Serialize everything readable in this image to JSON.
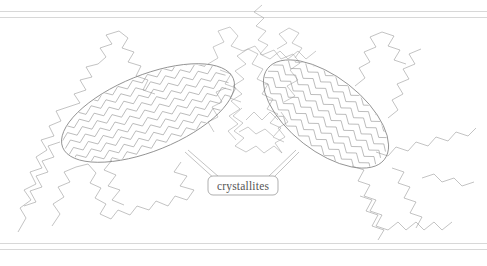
{
  "figure": {
    "name": "semicrystalline-polymer-morphology",
    "background_color": "#ffffff",
    "width": 487,
    "height": 266,
    "annotations": [
      {
        "id": "crystallites",
        "label": "crystallites",
        "box_x": 243,
        "box_y": 186
      }
    ],
    "colors": {
      "chain_stroke": "#9a9a9a",
      "lamella_stroke": "#7d7d7d",
      "rule_stroke": "#d8d8d8",
      "label_text": "#555555",
      "label_border": "#8d8d8d"
    },
    "rules": {
      "top": [
        11,
        17
      ],
      "bottom": [
        243,
        249
      ]
    },
    "crystallites": [
      {
        "id": "left-lamella",
        "cx": 148,
        "cy": 113,
        "rx": 92,
        "ry": 38,
        "rotation": -22,
        "chain_rows": 9,
        "description": "elongated oval containing parallel chain-folded zigzag segments"
      },
      {
        "id": "right-lamella",
        "cx": 326,
        "cy": 114,
        "rx": 74,
        "ry": 37,
        "rotation": 38,
        "chain_rows": 9,
        "description": "elongated oval containing parallel chain-folded zigzag segments"
      }
    ],
    "amorphous_region": {
      "id": "amorphous-tangle",
      "center_x": 252,
      "center_y": 92,
      "description": "dense randomly coiled polymer chains between and around the crystallites"
    }
  }
}
